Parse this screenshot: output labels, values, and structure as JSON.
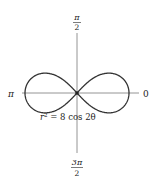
{
  "figure": {
    "type": "polar-graph",
    "curve": "lemniscate",
    "equation": "r² = 8 cos 2θ",
    "equation_parts": {
      "lhs": "r",
      "exp": "2",
      "rhs": " = 8 cos 2θ"
    },
    "axis_labels": {
      "right": "0",
      "left": "π",
      "top": {
        "num": "π",
        "den": "2"
      },
      "bottom": {
        "num": "3π",
        "den": "2"
      }
    },
    "colors": {
      "curve": "#333333",
      "axis": "#888888",
      "background": "#ffffff"
    }
  }
}
